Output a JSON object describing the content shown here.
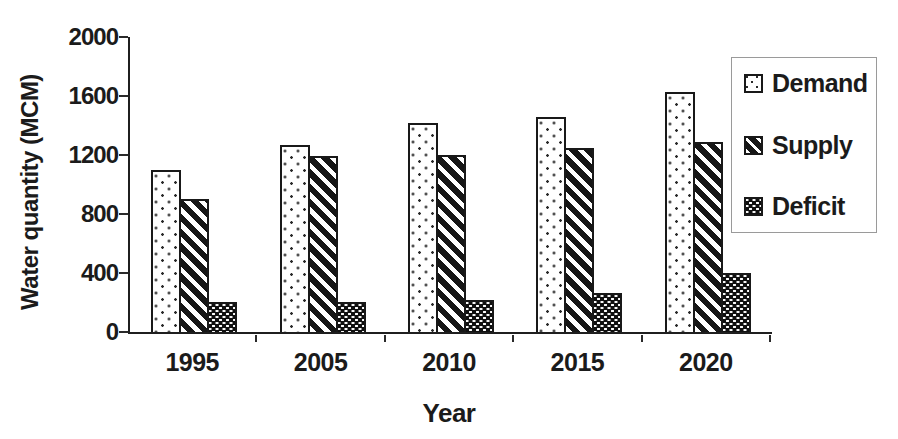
{
  "figure": {
    "background": "#ffffff",
    "ink_color": "#1b1b1b"
  },
  "chart_data": {
    "type": "bar",
    "title": "",
    "xlabel": "Year",
    "ylabel": "Water quantity (MCM)",
    "categories": [
      "1995",
      "2005",
      "2010",
      "2015",
      "2020"
    ],
    "series": [
      {
        "name": "Demand",
        "pattern": "dots",
        "values": [
          1100,
          1270,
          1420,
          1455,
          1630
        ]
      },
      {
        "name": "Supply",
        "pattern": "diagonal-stripes",
        "values": [
          900,
          1190,
          1200,
          1250,
          1290
        ]
      },
      {
        "name": "Deficit",
        "pattern": "checker",
        "values": [
          200,
          205,
          220,
          265,
          400
        ]
      }
    ],
    "ylim": [
      0,
      2000
    ],
    "yticks": [
      0,
      400,
      800,
      1200,
      1600,
      2000
    ],
    "grid": false,
    "legend_position": "upper-right",
    "bar_fill": "#ffffff",
    "bar_outline": "#191919"
  },
  "legend": {
    "items": [
      {
        "label": "Demand",
        "pattern": "dots"
      },
      {
        "label": "Supply",
        "pattern": "diagonal-stripes"
      },
      {
        "label": "Deficit",
        "pattern": "checker"
      }
    ]
  }
}
